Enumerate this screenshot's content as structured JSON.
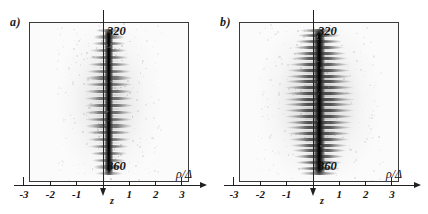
{
  "figure": {
    "type": "two-panel-grayscale-density-plot",
    "background_color": "#ffffff",
    "ink_color": "#202020"
  },
  "chart_data": {
    "type": "heatmap",
    "title": "",
    "panels": [
      {
        "id": "a",
        "label": "a)",
        "xlabel": "ρ/Δ",
        "ylabel": "z",
        "y_direction": "downward",
        "xlim": [
          -3,
          3
        ],
        "xticks": [
          -3,
          -2,
          -1,
          1,
          2,
          3
        ],
        "xticklabels": [
          "-3",
          "-2",
          "-1",
          "1",
          "2",
          "3"
        ],
        "annotations": [
          {
            "text": "320",
            "position": "top-center-right",
            "meaning": "z value at top of frame"
          },
          {
            "text": "360",
            "position": "bottom-center-right",
            "meaning": "z value at bottom of frame"
          }
        ],
        "ylim": [
          320,
          360
        ],
        "grid": false,
        "legend": null,
        "colormap": "grayscale-inverted",
        "description": "Narrow dark vertical filament on axis with symmetric horizontal fishbone rungs; lateral extent about |ρ/Δ| < 1.2, faint halo to |ρ/Δ| ~ 2",
        "structure": {
          "core_half_width_rho": 0.18,
          "rung_count": 22,
          "rung_half_length_rho": 0.95,
          "halo_half_width_rho": 2.0,
          "core_intensity": 1.0,
          "rung_intensity": 0.62,
          "halo_intensity": 0.12
        }
      },
      {
        "id": "b",
        "label": "b)",
        "xlabel": "ρ/Δ",
        "ylabel": "z",
        "y_direction": "downward",
        "xlim": [
          -3,
          3
        ],
        "xticks": [
          -3,
          -2,
          -1,
          1,
          2,
          3
        ],
        "xticklabels": [
          "-3",
          "-2",
          "-1",
          "1",
          "2",
          "3"
        ],
        "annotations": [
          {
            "text": "320",
            "position": "top-center-right",
            "meaning": "z value at top of frame"
          },
          {
            "text": "360",
            "position": "bottom-center-right",
            "meaning": "z value at bottom of frame"
          }
        ],
        "ylim": [
          320,
          360
        ],
        "grid": false,
        "legend": null,
        "colormap": "grayscale-inverted",
        "description": "Wider and more strongly modulated fishbone pattern than panel a; dark core plus long regular horizontal rungs reaching |ρ/Δ| ~ 1.5, halo to |ρ/Δ| ~ 2.4",
        "structure": {
          "core_half_width_rho": 0.22,
          "rung_count": 26,
          "rung_half_length_rho": 1.35,
          "halo_half_width_rho": 2.4,
          "core_intensity": 1.0,
          "rung_intensity": 0.78,
          "halo_intensity": 0.16
        }
      }
    ]
  }
}
